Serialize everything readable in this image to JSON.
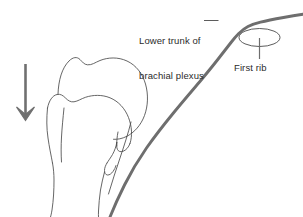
{
  "figure": {
    "name": "shoulder-brachial-plexus-line-drawing",
    "background_color": "#ffffff",
    "width": 303,
    "height": 217,
    "line_color_bone": "#4a4a4a",
    "line_color_nerve": "#6e6e6e",
    "line_color_arrow": "#707070",
    "text_color": "#2b2b2b"
  },
  "labels": {
    "plexus": {
      "line1": "Lower trunk of",
      "line2": "brachial plexus"
    },
    "first_rib": "First rib"
  },
  "annotations": {
    "traction_arrow": "downward-traction-arrow",
    "plexus_leader": "horizontal-leader-line",
    "first_rib_leader": "vertical-leader-line",
    "first_rib_marker": "ellipse-marker"
  }
}
